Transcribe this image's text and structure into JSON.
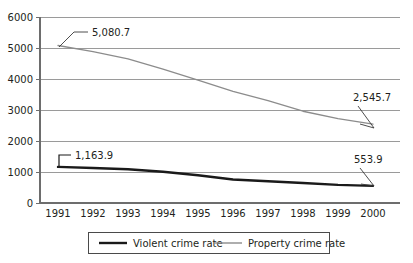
{
  "chart_data": {
    "type": "line",
    "title": "",
    "xlabel": "",
    "ylabel": "",
    "categories": [
      "1991",
      "1992",
      "1993",
      "1994",
      "1995",
      "1996",
      "1997",
      "1998",
      "1999",
      "2000"
    ],
    "ylim": [
      0,
      6000
    ],
    "y_ticks": [
      "0",
      "1000",
      "2000",
      "3000",
      "4000",
      "5000",
      "6000"
    ],
    "y_tick_values": [
      0,
      1000,
      2000,
      3000,
      4000,
      5000,
      6000
    ],
    "grid": true,
    "legend_position": "bottom",
    "series": [
      {
        "name": "Violent crime rate",
        "color": "#1a1a1a",
        "values": [
          1163.9,
          1130.0,
          1090.0,
          1010.0,
          895.0,
          760.0,
          700.0,
          645.0,
          585.0,
          553.9
        ]
      },
      {
        "name": "Property crime rate",
        "color": "#8c8c8c",
        "values": [
          5080.7,
          4880.0,
          4650.0,
          4320.0,
          3960.0,
          3600.0,
          3300.0,
          2960.0,
          2720.0,
          2545.7
        ]
      }
    ],
    "annotations": [
      {
        "text": "5,080.7",
        "series": "Property crime rate",
        "category": "1991",
        "value": 5080.7
      },
      {
        "text": "2,545.7",
        "series": "Property crime rate",
        "category": "2000",
        "value": 2545.7
      },
      {
        "text": "1,163.9",
        "series": "Violent crime rate",
        "category": "1991",
        "value": 1163.9
      },
      {
        "text": "553.9",
        "series": "Violent crime rate",
        "category": "2000",
        "value": 553.9
      }
    ]
  },
  "axis": {
    "y_labels": [
      "6000",
      "5000",
      "4000",
      "3000",
      "2000",
      "1000",
      "0"
    ],
    "x_labels": [
      "1991",
      "1992",
      "1993",
      "1994",
      "1995",
      "1996",
      "1997",
      "1998",
      "1999",
      "2000"
    ]
  },
  "annotations": {
    "property_start": "5,080.7",
    "property_end": "2,545.7",
    "violent_start": "1,163.9",
    "violent_end": "553.9"
  },
  "legend": {
    "items": [
      {
        "label": "Violent crime rate",
        "color": "#1a1a1a"
      },
      {
        "label": "Property crime rate",
        "color": "#8c8c8c"
      }
    ]
  },
  "colors": {
    "violent": "#1a1a1a",
    "property": "#8c8c8c",
    "grid": "#9a9a9a",
    "axis": "#6d6d6d",
    "text": "#231f20",
    "background": "#ffffff"
  }
}
